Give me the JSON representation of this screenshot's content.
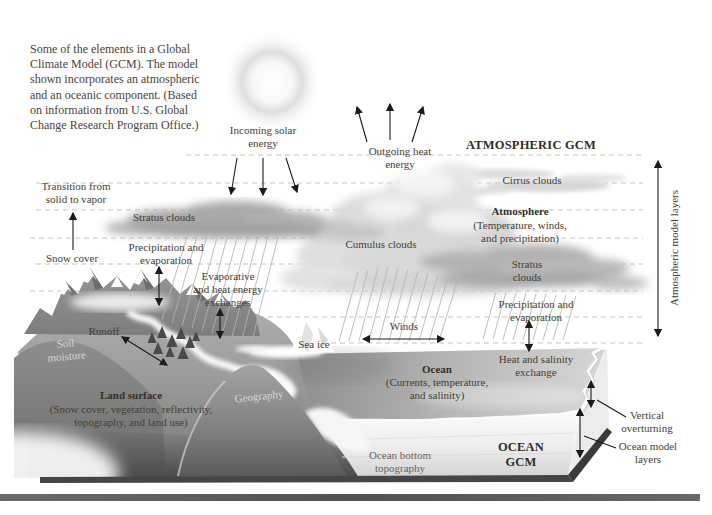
{
  "caption": "Some of the elements in a Global\nClimate Model (GCM). The model\nshown incorporates an atmospheric\nand an oceanic component. (Based\non information from U.S. Global\nChange Research Program Office.)",
  "colors": {
    "label_text": "#443e33",
    "dashed_line": "#c2c2c2",
    "bottom_bar": "#575757"
  },
  "sky": {
    "incoming": "Incoming solar\nenergy",
    "outgoing": "Outgoing heat\nenergy",
    "atmospheric_gcm": "ATMOSPHERIC GCM",
    "cirrus": "Cirrus clouds",
    "atmosphere_title": "Atmosphere",
    "atmosphere_detail": "(Temperature, winds,\nand precipitation)",
    "stratus_right": "Stratus\nclouds",
    "stratus_left": "Stratus clouds",
    "cumulus": "Cumulus clouds",
    "transition": "Transition from\nsolid to vapor",
    "atm_model_layers": "Atmospheric model layers"
  },
  "surface": {
    "snow_cover": "Snow cover",
    "precip_left": "Precipitation and\nevaporation",
    "evaporative": "Evaporative\nand heat energy\nexchanges",
    "precip_right": "Precipitation and\nevaporation",
    "heat_salinity": "Heat and salinity\nexchange",
    "winds": "Winds",
    "sea_ice": "Sea ice",
    "runoff": "Runoff",
    "soil_moisture": "Soil\nmoisture",
    "land_title": "Land surface",
    "land_detail": "(Snow cover, vegetation, reflectivity,\ntopography, and land use)",
    "geography": "Geography"
  },
  "ocean": {
    "ocean_title": "Ocean",
    "ocean_detail": "(Currents, temperature,\nand salinity)",
    "ocean_gcm": "OCEAN\nGCM",
    "ocean_bottom": "Ocean bottom\ntopography",
    "vertical_overturning": "Vertical\noverturning",
    "ocean_model_layers": "Ocean model\nlayers"
  }
}
